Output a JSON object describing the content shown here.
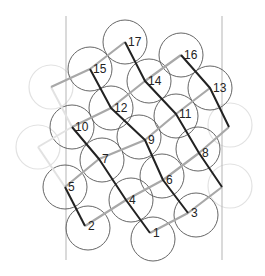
{
  "diagram": {
    "type": "circle-packing-lattice",
    "colors": {
      "background": "#ffffff",
      "circle": "#555555",
      "ghost_circle": "#e2e2e2",
      "dark_path": "#222222",
      "grey_path": "#a8a8a8",
      "ghost_path": "#e2e2e2",
      "guide": "#b5b5b5",
      "label": "#222222"
    },
    "guides": [
      {
        "x1": 66,
        "y1": 16,
        "x2": 66,
        "y2": 260
      },
      {
        "x1": 222,
        "y1": 16,
        "x2": 222,
        "y2": 260
      }
    ],
    "circle_radius": 22,
    "nodes": [
      {
        "id": "1",
        "label": "1",
        "x": 150,
        "y": 233
      },
      {
        "id": "2",
        "label": "2",
        "x": 85,
        "y": 226
      },
      {
        "id": "3",
        "label": "3",
        "x": 188,
        "y": 213
      },
      {
        "id": "4",
        "label": "4",
        "x": 126,
        "y": 200
      },
      {
        "id": "5",
        "label": "5",
        "x": 65,
        "y": 187
      },
      {
        "id": "6",
        "label": "6",
        "x": 163,
        "y": 180
      },
      {
        "id": "7",
        "label": "7",
        "x": 99,
        "y": 159
      },
      {
        "id": "8",
        "label": "8",
        "x": 199,
        "y": 153
      },
      {
        "id": "9",
        "label": "9",
        "x": 145,
        "y": 140
      },
      {
        "id": "10",
        "label": "10",
        "x": 72,
        "y": 127
      },
      {
        "id": "11",
        "label": "11",
        "x": 176,
        "y": 114
      },
      {
        "id": "12",
        "label": "12",
        "x": 111,
        "y": 108
      },
      {
        "id": "13",
        "label": "13",
        "x": 210,
        "y": 88
      },
      {
        "id": "14",
        "label": "14",
        "x": 145,
        "y": 81
      },
      {
        "id": "15",
        "label": "15",
        "x": 90,
        "y": 69
      },
      {
        "id": "16",
        "label": "16",
        "x": 181,
        "y": 55
      },
      {
        "id": "17",
        "label": "17",
        "x": 125,
        "y": 42
      }
    ],
    "extra_vertices": [
      {
        "id": "R1",
        "x": 229,
        "y": 127
      },
      {
        "id": "R2",
        "x": 222,
        "y": 187
      },
      {
        "id": "L1",
        "x": 51,
        "y": 87
      },
      {
        "id": "L2",
        "x": 38,
        "y": 147
      }
    ],
    "circles": [
      {
        "x": 153,
        "y": 239
      },
      {
        "x": 88,
        "y": 228
      },
      {
        "x": 196,
        "y": 215
      },
      {
        "x": 131,
        "y": 200
      },
      {
        "x": 65,
        "y": 187
      },
      {
        "x": 162,
        "y": 176
      },
      {
        "x": 102,
        "y": 160
      },
      {
        "x": 198,
        "y": 149
      },
      {
        "x": 139,
        "y": 137
      },
      {
        "x": 72,
        "y": 127
      },
      {
        "x": 176,
        "y": 116
      },
      {
        "x": 111,
        "y": 108
      },
      {
        "x": 210,
        "y": 88
      },
      {
        "x": 149,
        "y": 81
      },
      {
        "x": 90,
        "y": 69
      },
      {
        "x": 181,
        "y": 55
      },
      {
        "x": 125,
        "y": 42
      }
    ],
    "ghost_circles": [
      {
        "x": 51,
        "y": 87
      },
      {
        "x": 38,
        "y": 147
      },
      {
        "x": 230,
        "y": 125
      },
      {
        "x": 230,
        "y": 186
      }
    ],
    "dark_paths": [
      [
        "16",
        "13",
        "R1"
      ],
      [
        "17",
        "14",
        "11",
        "8",
        "R2"
      ],
      [
        "15",
        "12",
        "9",
        "6",
        "3"
      ],
      [
        "10",
        "7",
        "4",
        "1"
      ],
      [
        "5",
        "2"
      ]
    ],
    "grey_paths": [
      [
        "1",
        "3",
        "R2"
      ],
      [
        "2",
        "4",
        "6",
        "8",
        "R1"
      ],
      [
        "5",
        "7",
        "9",
        "11",
        "13"
      ],
      [
        "10",
        "12",
        "14",
        "16"
      ],
      [
        "L1",
        "15",
        "17"
      ]
    ],
    "ghost_paths": [
      [
        "L1",
        "10"
      ],
      [
        "L2",
        "5"
      ],
      [
        "L2",
        "10"
      ]
    ]
  }
}
